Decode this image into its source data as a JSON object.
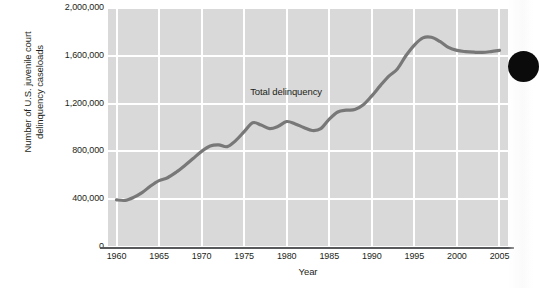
{
  "figure": {
    "background_color": "#ffffff",
    "plot_background_color": "#d9d9d9",
    "gridline_color": "#ffffff",
    "line_color": "#787878",
    "axis_color": "#58595b",
    "text_color": "#231f20"
  },
  "axis": {
    "ylabel_line1": "Number of U.S. juvenile court",
    "ylabel_line2": "delinquency caseloads",
    "xlabel": "Year"
  },
  "annotation": {
    "series_label": "Total delinquency"
  },
  "chart_data": {
    "type": "line",
    "title": "",
    "subtitle": "",
    "xlabel": "Year",
    "ylabel": "Number of U.S. juvenile court delinquency caseloads",
    "xlim": [
      1959,
      2006
    ],
    "ylim": [
      0,
      2000000
    ],
    "xticks": [
      1960,
      1965,
      1970,
      1975,
      1980,
      1985,
      1990,
      1995,
      2000,
      2005
    ],
    "xtick_labels": [
      "1960",
      "1965",
      "1970",
      "1975",
      "1980",
      "1985",
      "1990",
      "1995",
      "2000",
      "2005"
    ],
    "yticks": [
      0,
      400000,
      800000,
      1200000,
      1600000,
      2000000
    ],
    "ytick_labels": [
      "0",
      "400,000",
      "800,000",
      "1,200,000",
      "1,600,000",
      "2,000,000"
    ],
    "grid": true,
    "grid_axis": "both",
    "legend": false,
    "legend_position": "inline-annotation",
    "annotations": [
      {
        "text": "Total delinquency",
        "x": 1981,
        "y": 1300000
      }
    ],
    "series": [
      {
        "name": "Total delinquency",
        "color": "#787878",
        "x": [
          1960,
          1961,
          1962,
          1963,
          1964,
          1965,
          1966,
          1967,
          1968,
          1969,
          1970,
          1971,
          1972,
          1973,
          1974,
          1975,
          1976,
          1977,
          1978,
          1979,
          1980,
          1981,
          1982,
          1983,
          1984,
          1985,
          1986,
          1987,
          1988,
          1989,
          1990,
          1991,
          1992,
          1993,
          1994,
          1995,
          1996,
          1997,
          1998,
          1999,
          2000,
          2001,
          2002,
          2003,
          2004,
          2005
        ],
        "values": [
          395000,
          390000,
          415000,
          455000,
          510000,
          555000,
          580000,
          625000,
          680000,
          740000,
          800000,
          845000,
          855000,
          840000,
          890000,
          965000,
          1040000,
          1020000,
          990000,
          1010000,
          1050000,
          1030000,
          1000000,
          975000,
          990000,
          1070000,
          1130000,
          1145000,
          1150000,
          1190000,
          1265000,
          1350000,
          1430000,
          1490000,
          1600000,
          1690000,
          1750000,
          1755000,
          1720000,
          1670000,
          1645000,
          1635000,
          1630000,
          1628000,
          1635000,
          1645000
        ]
      }
    ]
  },
  "artifacts": {
    "edge_dot_color": "#0b0b0b"
  }
}
